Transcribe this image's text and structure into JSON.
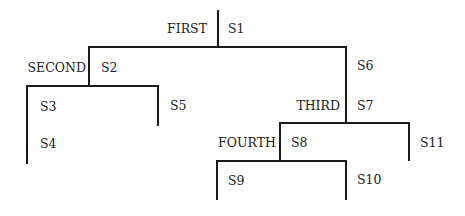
{
  "diagram": {
    "type": "tree",
    "line_color": "#1a1a1a",
    "text_color": "#222222",
    "nodes": [
      {
        "id": "first",
        "branch_label": "FIRST",
        "statement": "S1",
        "children": [
          "second",
          "s6"
        ]
      },
      {
        "id": "second",
        "branch_label": "SECOND",
        "statement": "S2",
        "children": [
          "s3",
          "s5"
        ]
      },
      {
        "id": "s3",
        "statements": [
          "S3",
          "S4"
        ]
      },
      {
        "id": "s5",
        "statements": [
          "S5"
        ]
      },
      {
        "id": "s6",
        "statements": [
          "S6"
        ],
        "branch_label": "THIRD",
        "statement": "S7",
        "children": [
          "fourth",
          "s11"
        ]
      },
      {
        "id": "fourth",
        "branch_label": "FOURTH",
        "statement": "S8",
        "children": [
          "s9",
          "s10"
        ]
      },
      {
        "id": "s9",
        "statements": [
          "S9"
        ]
      },
      {
        "id": "s10",
        "statements": [
          "S10"
        ]
      },
      {
        "id": "s11",
        "statements": [
          "S11"
        ]
      }
    ]
  },
  "labels": {
    "first": "FIRST",
    "s1": "S1",
    "second": "SECOND",
    "s2": "S2",
    "s3": "S3",
    "s4": "S4",
    "s5": "S5",
    "s6": "S6",
    "third": "THIRD",
    "s7": "S7",
    "fourth": "FOURTH",
    "s8": "S8",
    "s9": "S9",
    "s10": "S10",
    "s11": "S11"
  }
}
